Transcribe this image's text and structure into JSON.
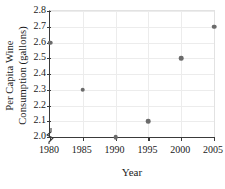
{
  "chart_data": {
    "type": "scatter",
    "title": "",
    "xlabel": "Year",
    "ylabel_lines": [
      "Per Capita Wine",
      "Consumption (gallons)"
    ],
    "ylabel": "Per Capita Wine Consumption (gallons)",
    "x": [
      1980,
      1985,
      1990,
      1995,
      2000,
      2005
    ],
    "values": [
      2.6,
      2.3,
      2.0,
      2.1,
      2.5,
      2.7
    ],
    "points": [
      {
        "x": 1980,
        "y": 2.6
      },
      {
        "x": 1985,
        "y": 2.3
      },
      {
        "x": 1990,
        "y": 2.0
      },
      {
        "x": 1995,
        "y": 2.1
      },
      {
        "x": 2000,
        "y": 2.5
      },
      {
        "x": 2005,
        "y": 2.7
      }
    ],
    "xlim": [
      1980,
      2005
    ],
    "ylim": [
      2.0,
      2.8
    ],
    "xticks": [
      1980,
      1985,
      1990,
      1995,
      2000,
      2005
    ],
    "xtick_labels": [
      "1980",
      "1985",
      "1990",
      "1995",
      "2000",
      "2005"
    ],
    "yticks": [
      2.0,
      2.1,
      2.2,
      2.3,
      2.4,
      2.5,
      2.6,
      2.7,
      2.8
    ],
    "ytick_labels": [
      "2.0",
      "2.1",
      "2.2",
      "2.3",
      "2.4",
      "2.5",
      "2.6",
      "2.7",
      "2.8"
    ],
    "grid": true,
    "legend": "none",
    "axis_break": {
      "axis": "y",
      "below": 2.0,
      "symbol": "zigzag"
    },
    "colors": {
      "marker": "#6b6b6b",
      "gridline": "#ececec",
      "spine": "#3a3a3a",
      "background": "#ffffff",
      "text": "#1a1a1a"
    }
  }
}
